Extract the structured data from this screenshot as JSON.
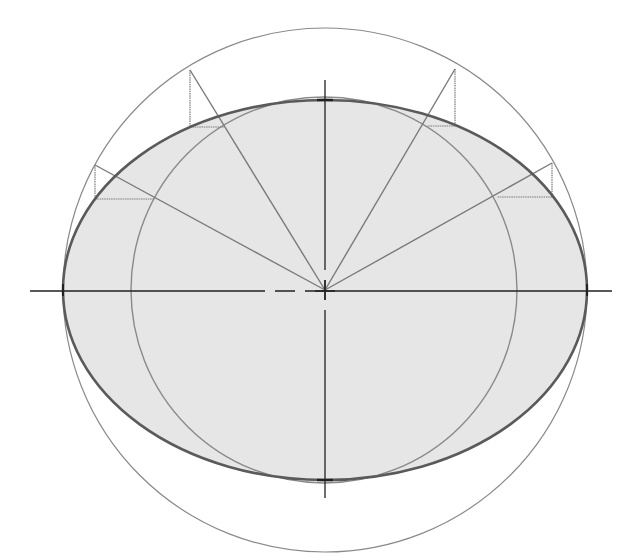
{
  "diagram": {
    "title": "",
    "canvas": {
      "width": 641,
      "height": 556,
      "background": "#ffffff"
    },
    "center": {
      "x": 325,
      "y": 290
    },
    "colors": {
      "ellipse_fill": "#e6e6e6",
      "ellipse_stroke": "#5a5a5a",
      "circle_stroke": "#8a8a8a",
      "axis_stroke": "#222222",
      "construction_stroke": "#7a7a7a"
    },
    "ellipse": {
      "rx": 262,
      "ry": 190
    },
    "outer_circle": {
      "r": 262
    },
    "inner_circle": {
      "r": 193
    },
    "axes": {
      "horizontal": {
        "x1": 30,
        "x2": 612,
        "y": 291
      },
      "vertical": {
        "x": 325,
        "y1": 80,
        "y2": 498
      }
    },
    "construction_points": [
      {
        "name": "upper-left-1",
        "outer": {
          "x": 190,
          "y": 70
        },
        "drop": {
          "x": 190,
          "y": 127
        },
        "inner": {
          "x": 224,
          "y": 127
        }
      },
      {
        "name": "upper-left-2",
        "outer": {
          "x": 95,
          "y": 165
        },
        "drop": {
          "x": 95,
          "y": 199
        },
        "inner": {
          "x": 155,
          "y": 199
        }
      },
      {
        "name": "upper-right-1",
        "outer": {
          "x": 455,
          "y": 69
        },
        "drop": {
          "x": 455,
          "y": 126
        },
        "inner": {
          "x": 427,
          "y": 126
        }
      },
      {
        "name": "upper-right-2",
        "outer": {
          "x": 552,
          "y": 163
        },
        "drop": {
          "x": 552,
          "y": 197
        },
        "inner": {
          "x": 497,
          "y": 197
        }
      }
    ]
  }
}
